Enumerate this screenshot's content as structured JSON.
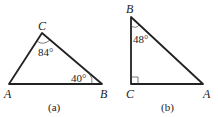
{
  "figures": [
    {
      "caption": "(a)",
      "vertices": {
        "A": "A",
        "B": "B",
        "C": "C"
      },
      "angles": {
        "C": "84°",
        "B": "40°"
      }
    },
    {
      "caption": "(b)",
      "vertices": {
        "A": "A",
        "B": "B",
        "C": "C"
      },
      "angles": {
        "B": "48°"
      },
      "right_angle_at": "C"
    }
  ],
  "colors": {
    "stroke": "#222222",
    "background": "#ffffff"
  }
}
